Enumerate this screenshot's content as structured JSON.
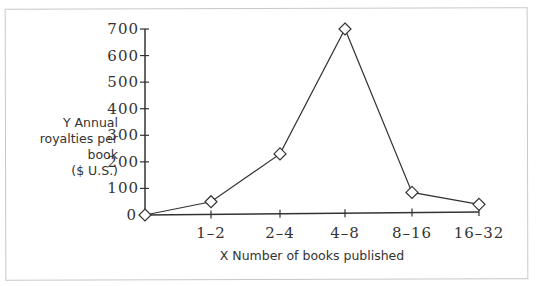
{
  "chart_data": {
    "type": "line",
    "title": "",
    "xlabel": "X  Number of books published",
    "ylabel_lines": [
      "Y Annual",
      "royalties per",
      "book",
      "($ U.S.)"
    ],
    "ylabel": "Y Annual royalties per book ($ U.S.)",
    "categories": [
      "0",
      "1-2",
      "2-4",
      "4-8",
      "8-16",
      "16-32"
    ],
    "x_tick_labels": [
      "1–2",
      "2–4",
      "4–8",
      "8–16",
      "16–32"
    ],
    "y_tick_labels": [
      "0",
      "100",
      "200",
      "300",
      "400",
      "500",
      "600",
      "700"
    ],
    "ylim": [
      0,
      700
    ],
    "grid": false,
    "legend": null,
    "marker": "diamond",
    "series": [
      {
        "name": "Annual royalties per book",
        "values": [
          0,
          50,
          230,
          700,
          85,
          40
        ]
      }
    ]
  },
  "colors": {
    "line": "#333333",
    "marker_fill": "#ffffff",
    "frame": "#c8c8c8"
  }
}
